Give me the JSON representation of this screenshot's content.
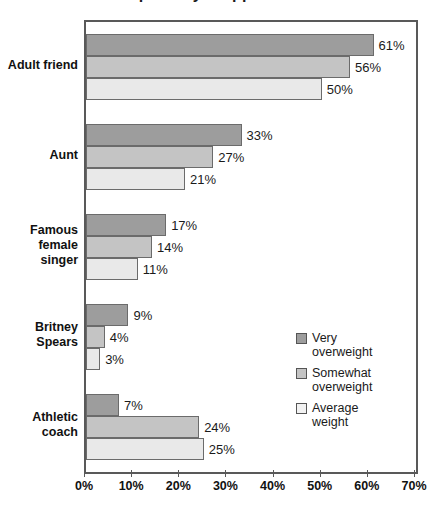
{
  "chart_data": {
    "type": "bar",
    "orientation": "horizontal",
    "title": "partially cropped title",
    "xlabel": "",
    "ylabel": "",
    "xlim": [
      0,
      70
    ],
    "xtick_labels": [
      "0%",
      "10%",
      "20%",
      "30%",
      "40%",
      "50%",
      "60%",
      "70%"
    ],
    "xticks": [
      0,
      10,
      20,
      30,
      40,
      50,
      60,
      70
    ],
    "grid": false,
    "legend_position": "inside-right",
    "categories": [
      "Adult friend",
      "Aunt",
      "Famous\nfemale\nsinger",
      "Britney\nSpears",
      "Athletic\ncoach"
    ],
    "series": [
      {
        "name": "Very\noverweight",
        "color": "#9d9d9d",
        "values": [
          61,
          33,
          17,
          9,
          7
        ],
        "value_labels": [
          "61%",
          "33%",
          "17%",
          "9%",
          "7%"
        ]
      },
      {
        "name": "Somewhat\noverweight",
        "color": "#c4c4c4",
        "values": [
          56,
          27,
          14,
          4,
          24
        ],
        "value_labels": [
          "56%",
          "27%",
          "14%",
          "4%",
          "24%"
        ]
      },
      {
        "name": "Average\nweight",
        "color": "#e9e9e9",
        "values": [
          50,
          21,
          11,
          3,
          25
        ],
        "value_labels": [
          "50%",
          "21%",
          "11%",
          "3%",
          "25%"
        ]
      }
    ]
  },
  "legend": {
    "items": [
      {
        "label": "Very\noverweight"
      },
      {
        "label": "Somewhat\noverweight"
      },
      {
        "label": "Average\nweight"
      }
    ]
  }
}
